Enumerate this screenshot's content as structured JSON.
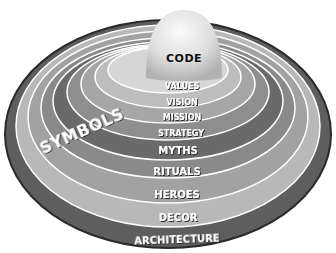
{
  "diagram": {
    "center": {
      "label": "CODE"
    },
    "arc_label": "SYMBOLS",
    "rings": [
      {
        "label": "VALUES",
        "fill": "#d6d6d6"
      },
      {
        "label": "VISION",
        "fill": "#bdbdbd"
      },
      {
        "label": "MISSION",
        "fill": "#a6a6a6"
      },
      {
        "label": "STRATEGY",
        "fill": "#8e8e8e"
      },
      {
        "label": "MYTHS",
        "fill": "#6a6a6a"
      },
      {
        "label": "RITUALS",
        "fill": "#8a8a8a"
      },
      {
        "label": "HEROES",
        "fill": "#a2a2a2"
      },
      {
        "label": "DECOR",
        "fill": "#b8b8b8"
      },
      {
        "label": "ARCHITECTURE",
        "fill": "#5e5e5e"
      }
    ],
    "colors": {
      "outline": "#2a2a2a",
      "divider": "#ffffff",
      "sphere_light": "#f4f4f4",
      "sphere_dark": "#bcbcbc",
      "label_text": "#ffffff",
      "code_text": "#111111"
    }
  }
}
